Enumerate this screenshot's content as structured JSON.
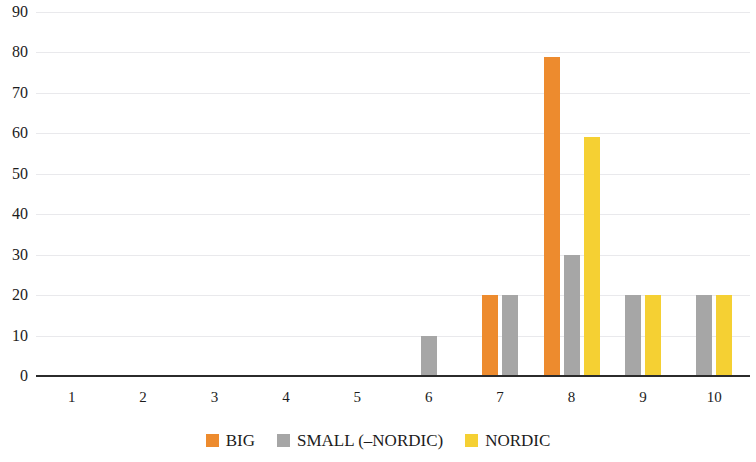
{
  "chart_data": {
    "type": "bar",
    "title": "",
    "subtitle": "",
    "xlabel": "",
    "ylabel": "",
    "categories": [
      "1",
      "2",
      "3",
      "4",
      "5",
      "6",
      "7",
      "8",
      "9",
      "10"
    ],
    "series": [
      {
        "name": "BIG",
        "color": "#ED8B2E",
        "values": [
          0,
          0,
          0,
          0,
          0,
          0,
          20,
          79,
          0,
          0
        ]
      },
      {
        "name": "SMALL (–NORDIC)",
        "color": "#A6A6A6",
        "values": [
          0,
          0,
          0,
          0,
          0,
          10,
          20,
          30,
          20,
          20
        ]
      },
      {
        "name": "NORDIC",
        "color": "#F5D033",
        "values": [
          0,
          0,
          0,
          0,
          0,
          0,
          0,
          59,
          20,
          20
        ]
      }
    ],
    "ylim": [
      0,
      90
    ],
    "yticks": [
      "0",
      "10",
      "20",
      "30",
      "40",
      "50",
      "60",
      "70",
      "80",
      "90"
    ],
    "ytick_values": [
      0,
      10,
      20,
      30,
      40,
      50,
      60,
      70,
      80,
      90
    ],
    "grid": true,
    "grid_axis": "y",
    "grid_color": "#E9E9EC",
    "axis_color": "#2B2B2B",
    "legend_position": "bottom",
    "background": "#FFFFFF"
  },
  "legend": {
    "items": [
      {
        "label": "BIG",
        "color": "#ED8B2E"
      },
      {
        "label": "SMALL (–NORDIC)",
        "color": "#A6A6A6"
      },
      {
        "label": "NORDIC",
        "color": "#F5D033"
      }
    ]
  }
}
